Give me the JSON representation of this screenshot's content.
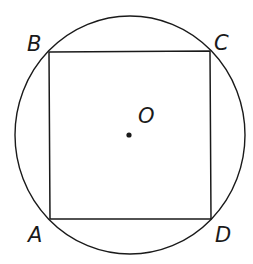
{
  "diagram": {
    "type": "square inscribed in circle",
    "circle": {
      "center_label": "O",
      "cx": 130,
      "cy": 135,
      "rx": 115,
      "ry": 119
    },
    "square": {
      "vertices": [
        {
          "label": "A",
          "x": 50,
          "y": 219
        },
        {
          "label": "B",
          "x": 49,
          "y": 52
        },
        {
          "label": "C",
          "x": 210,
          "y": 51
        },
        {
          "label": "D",
          "x": 211,
          "y": 219
        }
      ]
    },
    "labels": {
      "A": "A",
      "B": "B",
      "C": "C",
      "D": "D",
      "O": "O"
    },
    "colors": {
      "stroke": "#1a1a1a",
      "background": "#ffffff"
    }
  }
}
